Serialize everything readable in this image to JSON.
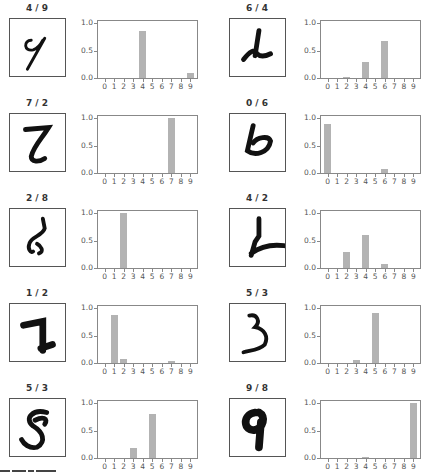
{
  "chart_data": [
    {
      "type": "bar",
      "title": "4 / 9",
      "categories": [
        "0",
        "1",
        "2",
        "3",
        "4",
        "5",
        "6",
        "7",
        "8",
        "9"
      ],
      "values": [
        0,
        0,
        0,
        0,
        0.86,
        0,
        0,
        0,
        0,
        0.1
      ],
      "ylim": [
        0,
        1
      ],
      "yticks": [
        "0.0",
        "0.5",
        "1.0"
      ]
    },
    {
      "type": "bar",
      "title": "6 / 4",
      "categories": [
        "0",
        "1",
        "2",
        "3",
        "4",
        "5",
        "6",
        "7",
        "8",
        "9"
      ],
      "values": [
        0,
        0,
        0.01,
        0,
        0.29,
        0,
        0.68,
        0,
        0,
        0
      ],
      "ylim": [
        0,
        1
      ],
      "yticks": [
        "0.0",
        "0.5",
        "1.0"
      ]
    },
    {
      "type": "bar",
      "title": "7 / 2",
      "categories": [
        "0",
        "1",
        "2",
        "3",
        "4",
        "5",
        "6",
        "7",
        "8",
        "9"
      ],
      "values": [
        0,
        0,
        0,
        0,
        0,
        0,
        0,
        1.0,
        0,
        0
      ],
      "ylim": [
        0,
        1
      ],
      "yticks": [
        "0.0",
        "0.5",
        "1.0"
      ]
    },
    {
      "type": "bar",
      "title": "0 / 6",
      "categories": [
        "0",
        "1",
        "2",
        "3",
        "4",
        "5",
        "6",
        "7",
        "8",
        "9"
      ],
      "values": [
        0.9,
        0,
        0,
        0,
        0,
        0,
        0.08,
        0,
        0,
        0
      ],
      "ylim": [
        0,
        1
      ],
      "yticks": [
        "0.0",
        "0.5",
        "1.0"
      ]
    },
    {
      "type": "bar",
      "title": "2 / 8",
      "categories": [
        "0",
        "1",
        "2",
        "3",
        "4",
        "5",
        "6",
        "7",
        "8",
        "9"
      ],
      "values": [
        0,
        0,
        1.0,
        0,
        0,
        0,
        0,
        0,
        0,
        0
      ],
      "ylim": [
        0,
        1
      ],
      "yticks": [
        "0.0",
        "0.5",
        "1.0"
      ]
    },
    {
      "type": "bar",
      "title": "4 / 2",
      "categories": [
        "0",
        "1",
        "2",
        "3",
        "4",
        "5",
        "6",
        "7",
        "8",
        "9"
      ],
      "values": [
        0,
        0,
        0.3,
        0,
        0.6,
        0,
        0.08,
        0,
        0,
        0
      ],
      "ylim": [
        0,
        1
      ],
      "yticks": [
        "0.0",
        "0.5",
        "1.0"
      ]
    },
    {
      "type": "bar",
      "title": "1 / 2",
      "categories": [
        "0",
        "1",
        "2",
        "3",
        "4",
        "5",
        "6",
        "7",
        "8",
        "9"
      ],
      "values": [
        0,
        0.87,
        0.07,
        0,
        0,
        0,
        0,
        0.04,
        0,
        0
      ],
      "ylim": [
        0,
        1
      ],
      "yticks": [
        "0.0",
        "0.5",
        "1.0"
      ]
    },
    {
      "type": "bar",
      "title": "5 / 3",
      "categories": [
        "0",
        "1",
        "2",
        "3",
        "4",
        "5",
        "6",
        "7",
        "8",
        "9"
      ],
      "values": [
        0,
        0,
        0,
        0.05,
        0,
        0.92,
        0,
        0,
        0,
        0
      ],
      "ylim": [
        0,
        1
      ],
      "yticks": [
        "0.0",
        "0.5",
        "1.0"
      ]
    },
    {
      "type": "bar",
      "title": "5 / 3",
      "categories": [
        "0",
        "1",
        "2",
        "3",
        "4",
        "5",
        "6",
        "7",
        "8",
        "9"
      ],
      "values": [
        0,
        0,
        0,
        0.18,
        0,
        0.81,
        0,
        0,
        0,
        0
      ],
      "ylim": [
        0,
        1
      ],
      "yticks": [
        "0.0",
        "0.5",
        "1.0"
      ]
    },
    {
      "type": "bar",
      "title": "9 / 8",
      "categories": [
        "0",
        "1",
        "2",
        "3",
        "4",
        "5",
        "6",
        "7",
        "8",
        "9"
      ],
      "values": [
        0,
        0,
        0,
        0,
        0.01,
        0,
        0,
        0,
        0,
        1.0
      ],
      "ylim": [
        0,
        1
      ],
      "yticks": [
        "0.0",
        "0.5",
        "1.0"
      ]
    }
  ],
  "colors": {
    "bar": "#b3b3b3",
    "axis": "#888888",
    "text": "#333333"
  },
  "digits": [
    "9",
    "4",
    "2",
    "6",
    "8",
    "2",
    "1",
    "3",
    "8",
    "9"
  ]
}
